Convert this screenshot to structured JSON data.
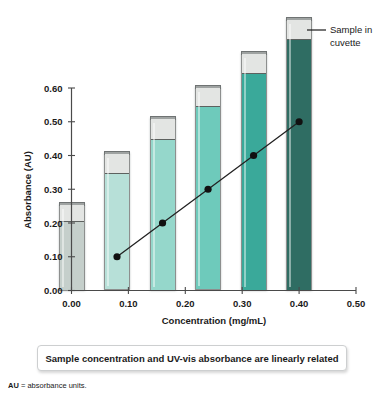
{
  "chart_data": {
    "type": "scatter",
    "title": "",
    "xlabel": "Concentration (mg/mL)",
    "ylabel": "Absorbance (AU)",
    "xlim": [
      0.0,
      0.5
    ],
    "ylim": [
      0.0,
      0.6
    ],
    "grid": false,
    "legend": "none",
    "x_ticks": [
      "0.00",
      "0.10",
      "0.20",
      "0.30",
      "0.40",
      "0.50"
    ],
    "y_ticks": [
      "0.00",
      "0.10",
      "0.20",
      "0.30",
      "0.40",
      "0.50",
      "0.60"
    ],
    "x": [
      0.08,
      0.16,
      0.24,
      0.32,
      0.4
    ],
    "values": [
      0.1,
      0.2,
      0.3,
      0.4,
      0.5
    ],
    "series": [
      {
        "name": "Absorbance vs concentration",
        "x": [
          0.08,
          0.16,
          0.24,
          0.32,
          0.4
        ],
        "values": [
          0.1,
          0.2,
          0.3,
          0.4,
          0.5
        ],
        "marker": "filled-circle",
        "marker_color": "#111111",
        "line_color": "#222222"
      }
    ],
    "annotations": [
      {
        "name": "sample-in-cuvette",
        "text_line1": "Sample in",
        "text_line2": "cuvette",
        "leader": true
      }
    ],
    "cuvettes": [
      {
        "concentration": 0.0,
        "fill_level": 0.205,
        "top": 0.255,
        "color": "#c5cfcb",
        "label": "blank-cuvette"
      },
      {
        "concentration": 0.08,
        "fill_level": 0.347,
        "top": 0.408,
        "color": "#b7e0d8",
        "label": "cuvette-1"
      },
      {
        "concentration": 0.16,
        "fill_level": 0.449,
        "top": 0.51,
        "color": "#95d7cb",
        "label": "cuvette-2"
      },
      {
        "concentration": 0.24,
        "fill_level": 0.546,
        "top": 0.604,
        "color": "#6ecabb",
        "label": "cuvette-3"
      },
      {
        "concentration": 0.32,
        "fill_level": 0.645,
        "top": 0.705,
        "color": "#3aa99a",
        "label": "cuvette-4"
      },
      {
        "concentration": 0.4,
        "fill_level": 0.745,
        "top": 0.805,
        "color": "#2f6d63",
        "label": "cuvette-5"
      }
    ]
  },
  "caption": {
    "text": "Sample concentration and UV-vis absorbance are linearly related"
  },
  "footnote": {
    "abbrev": "AU",
    "definition": "= absorbance units."
  },
  "colors": {
    "axis": "#4a4a4a",
    "marker": "#111111",
    "caption_border": "#cdcfd0",
    "cuvette_cap": "#9fa3a2",
    "cuvette_headspace": "#e3e5e3"
  }
}
